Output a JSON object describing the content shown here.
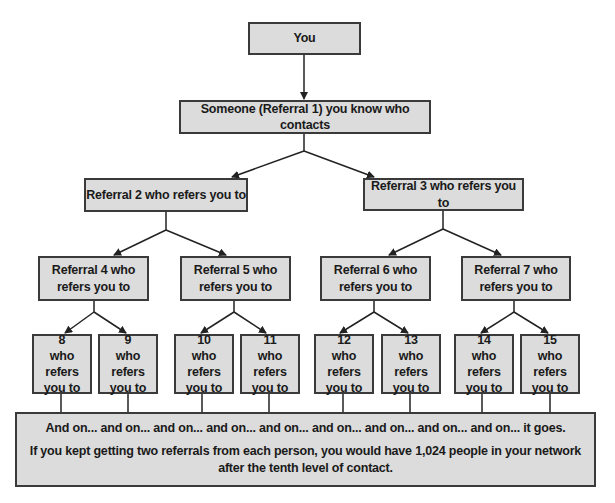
{
  "diagram": {
    "root": {
      "label": "You"
    },
    "level1": {
      "label": "Someone (Referral 1) you know who contacts"
    },
    "level2": [
      {
        "label": "Referral 2 who refers you to"
      },
      {
        "label": "Referral 3 who refers you to"
      }
    ],
    "level3": [
      {
        "line1": "Referral 4 who",
        "line2": "refers you to"
      },
      {
        "line1": "Referral 5 who",
        "line2": "refers you to"
      },
      {
        "line1": "Referral 6 who",
        "line2": "refers you to"
      },
      {
        "line1": "Referral 7 who",
        "line2": "refers you to"
      }
    ],
    "level4": [
      {
        "number": "8",
        "line2": "who refers",
        "line3": "you to"
      },
      {
        "number": "9",
        "line2": "who refers",
        "line3": "you to"
      },
      {
        "number": "10",
        "line2": "who refers",
        "line3": "you to"
      },
      {
        "number": "11",
        "line2": "who refers",
        "line3": "you to"
      },
      {
        "number": "12",
        "line2": "who refers",
        "line3": "you to"
      },
      {
        "number": "13",
        "line2": "who refers",
        "line3": "you to"
      },
      {
        "number": "14",
        "line2": "who refers",
        "line3": "you to"
      },
      {
        "number": "15",
        "line2": "who refers",
        "line3": "you to"
      }
    ],
    "footer": {
      "line1": "And on... and on... and on... and on... and on... and on... and on... and on... and on... it goes.",
      "line2": "If you kept getting two referrals from each person, you would have 1,024 people in your network after the tenth level of contact."
    },
    "colors": {
      "box_fill": "#dcdcdc",
      "border": "#3a3a3a",
      "text": "#1a1a1a"
    }
  }
}
